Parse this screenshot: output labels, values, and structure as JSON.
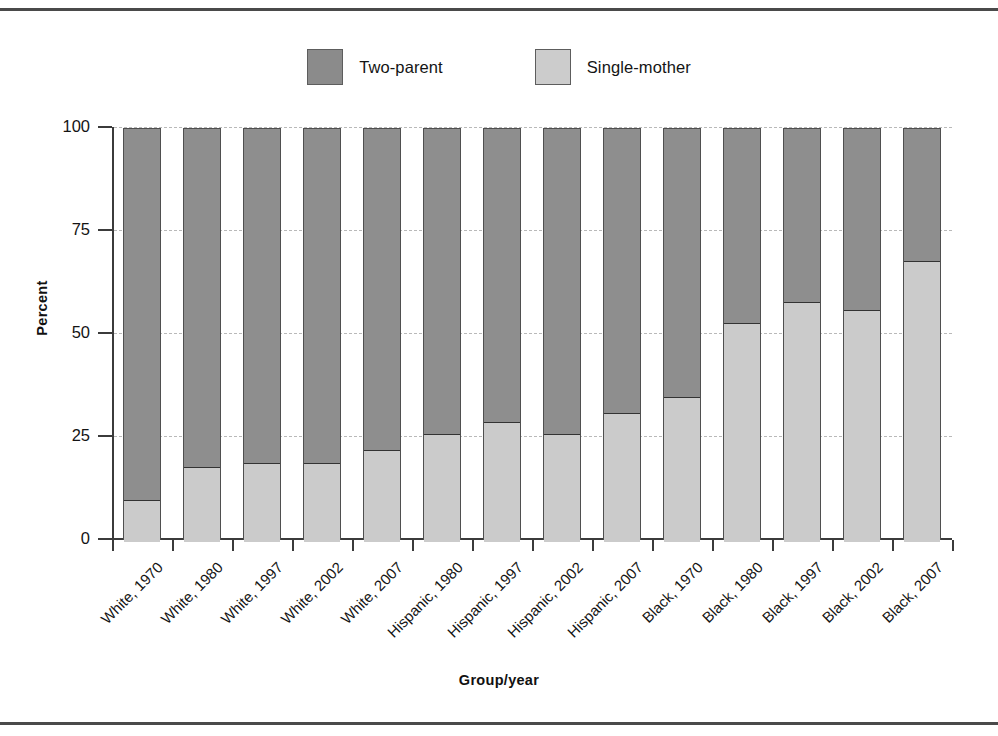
{
  "chart_data": {
    "type": "bar",
    "subtype": "stacked-100-percent",
    "title": "",
    "xlabel": "Group/year",
    "ylabel": "Percent",
    "ylim": [
      0,
      100
    ],
    "yticks": [
      0,
      25,
      50,
      75,
      100
    ],
    "grid": "horizontal-dashed",
    "legend_position": "top-center",
    "categories": [
      "White, 1970",
      "White, 1980",
      "White, 1997",
      "White, 2002",
      "White, 2007",
      "Hispanic, 1980",
      "Hispanic, 1997",
      "Hispanic, 2002",
      "Hispanic, 2007",
      "Black, 1970",
      "Black, 1980",
      "Black, 1997",
      "Black, 2002",
      "Black, 2007"
    ],
    "series": [
      {
        "name": "Single-mother",
        "color": "#cbcbcb",
        "values": [
          10,
          18,
          19,
          19,
          22,
          26,
          29,
          26,
          31,
          35,
          53,
          58,
          56,
          68
        ]
      },
      {
        "name": "Two-parent",
        "color": "#8e8e8e",
        "values": [
          90,
          82,
          81,
          81,
          78,
          74,
          71,
          74,
          69,
          65,
          47,
          42,
          44,
          32
        ]
      }
    ]
  },
  "legend": {
    "items": [
      {
        "label": "Two-parent",
        "color": "#8e8e8e"
      },
      {
        "label": "Single-mother",
        "color": "#cbcbcb"
      }
    ]
  },
  "axes": {
    "y_title": "Percent",
    "x_title": "Group/year",
    "y_tick_labels": [
      "100",
      "75",
      "50",
      "25",
      "0"
    ]
  }
}
